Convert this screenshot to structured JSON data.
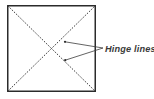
{
  "figure": {
    "type": "diagram",
    "background_color": "#ffffff",
    "canvas": {
      "width": 154,
      "height": 99
    },
    "shapes": {
      "square": {
        "name": "panel-square",
        "x": 7,
        "y": 5,
        "width": 89,
        "height": 87,
        "stroke_color": "#2b2b2b",
        "stroke_width": 1.5,
        "fill": "none"
      },
      "diagonals": [
        {
          "name": "diagonal-top-left-to-bottom-right",
          "x1": 7.5,
          "y1": 5.5,
          "x2": 95.5,
          "y2": 91.5,
          "stroke_color": "#3c3c3c",
          "stroke_width": 1.0,
          "dash": "1.6 1.4"
        },
        {
          "name": "diagonal-bottom-left-to-top-right",
          "x1": 7.5,
          "y1": 91.5,
          "x2": 95.5,
          "y2": 5.5,
          "stroke_color": "#3c3c3c",
          "stroke_width": 1.0,
          "dash": "1.6 1.4"
        }
      ],
      "leader_lines": [
        {
          "name": "leader-line-upper",
          "x1": 103.0,
          "y1": 48.0,
          "x2": 65.0,
          "y2": 41.8,
          "stroke_color": "#3c3c3c",
          "stroke_width": 0.8
        },
        {
          "name": "leader-line-lower",
          "x1": 103.0,
          "y1": 48.0,
          "x2": 65.2,
          "y2": 60.2,
          "stroke_color": "#3c3c3c",
          "stroke_width": 0.8
        }
      ],
      "leader_endpoints": [
        {
          "name": "leader-endpoint-upper",
          "cx": 65.0,
          "cy": 41.8,
          "r": 1.1,
          "color": "#2b2b2b"
        },
        {
          "name": "leader-endpoint-lower",
          "cx": 65.2,
          "cy": 60.2,
          "r": 1.1,
          "color": "#2b2b2b"
        }
      ]
    },
    "annotation": {
      "name": "hinge-lines-label",
      "text": "Hinge lines",
      "x": 105,
      "y": 51.5,
      "color": "#3a3a3a",
      "font_style": "italic"
    }
  }
}
